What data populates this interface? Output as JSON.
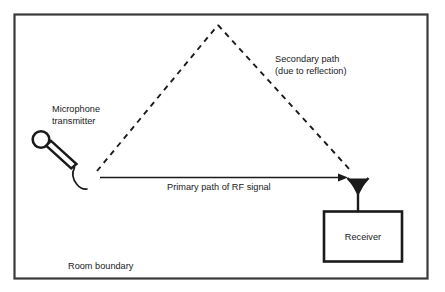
{
  "figure": {
    "type": "technical-diagram",
    "background_color": "#ffffff",
    "line_color": "#1a1a1a",
    "border_color": "#3a3a3a"
  },
  "room": {
    "label": "Room boundary",
    "border_name": "room-boundary-rectangle"
  },
  "transmitter": {
    "label_line1": "Microphone",
    "label_line2": "transmitter",
    "icon_name": "microphone-icon"
  },
  "receiver": {
    "label": "Receiver",
    "box_name": "receiver-box",
    "antenna_name": "receiver-antenna-icon"
  },
  "paths": {
    "primary": {
      "label": "Primary path of RF signal",
      "style": "solid-arrow"
    },
    "secondary": {
      "label_line1": "Secondary path",
      "label_line2": "(due to reflection)",
      "style": "dashed-arrow"
    }
  }
}
